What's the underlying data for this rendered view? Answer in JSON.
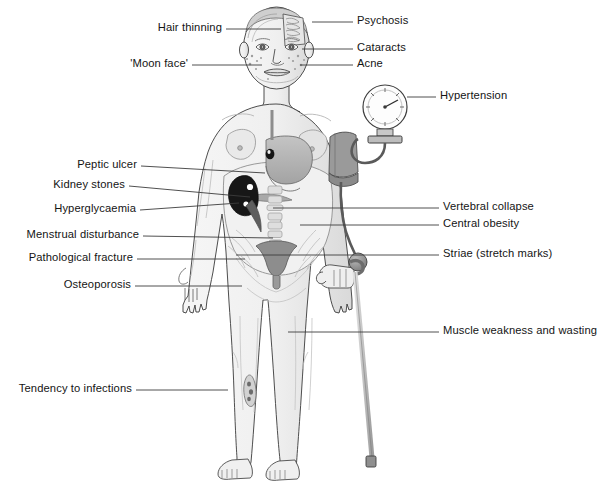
{
  "figure": {
    "background_color": "#ffffff",
    "line_color": "#3c3c3c",
    "text_color": "#141414",
    "skin_fill": "#f2f2f2",
    "skin_shadow": "#dcdcdc",
    "organ_fill": "#b8b8b8",
    "organ_dark": "#8f8f8f",
    "kidney_fill": "#171717",
    "stone_fill": "#ffffff",
    "cuff_fill": "#9a9a9a",
    "gauge_fill": "#fdfdfd",
    "cane_fill": "#c9c9c9"
  },
  "labels_left": [
    {
      "id": "hair-thinning",
      "text": "Hair thinning",
      "text_x": 222,
      "text_y": 32,
      "line_x1": 226,
      "line_y1": 29,
      "line_x2": 281,
      "line_y2": 29
    },
    {
      "id": "moon-face",
      "text": "'Moon face'",
      "text_x": 188,
      "text_y": 68,
      "line_x1": 192,
      "line_y1": 65,
      "line_x2": 262,
      "line_y2": 65
    },
    {
      "id": "peptic-ulcer",
      "text": "Peptic ulcer",
      "text_x": 137,
      "text_y": 169,
      "line_x1": 141,
      "line_y1": 166,
      "line_x2": 265,
      "line_y2": 173
    },
    {
      "id": "kidney-stones",
      "text": "Kidney stones",
      "text_x": 125,
      "text_y": 189,
      "line_x1": 129,
      "line_y1": 186,
      "line_x2": 250,
      "line_y2": 197
    },
    {
      "id": "hyperglycaemia",
      "text": "Hyperglycaemia",
      "text_x": 136,
      "text_y": 213,
      "line_x1": 140,
      "line_y1": 210,
      "line_x2": 239,
      "line_y2": 203
    },
    {
      "id": "menstrual-disturbance",
      "text": "Menstrual disturbance",
      "text_x": 139,
      "text_y": 239,
      "line_x1": 143,
      "line_y1": 236,
      "line_x2": 273,
      "line_y2": 238
    },
    {
      "id": "pathological-fracture",
      "text": "Pathological fracture",
      "text_x": 133,
      "text_y": 262,
      "line_x1": 137,
      "line_y1": 259,
      "line_x2": 245,
      "line_y2": 259
    },
    {
      "id": "osteoporosis",
      "text": "Osteoporosis",
      "text_x": 131,
      "text_y": 289,
      "line_x1": 135,
      "line_y1": 286,
      "line_x2": 242,
      "line_y2": 286
    },
    {
      "id": "tendency-to-infections",
      "text": "Tendency to infections",
      "text_x": 132,
      "text_y": 393,
      "line_x1": 136,
      "line_y1": 390,
      "line_x2": 228,
      "line_y2": 390
    }
  ],
  "labels_right": [
    {
      "id": "psychosis",
      "text": "Psychosis",
      "text_x": 357,
      "text_y": 25,
      "line_x1": 312,
      "line_y1": 22,
      "line_x2": 353,
      "line_y2": 22
    },
    {
      "id": "cataracts",
      "text": "Cataracts",
      "text_x": 357,
      "text_y": 52,
      "line_x1": 302,
      "line_y1": 49,
      "line_x2": 353,
      "line_y2": 49
    },
    {
      "id": "acne",
      "text": "Acne",
      "text_x": 357,
      "text_y": 68,
      "line_x1": 300,
      "line_y1": 65,
      "line_x2": 353,
      "line_y2": 65
    },
    {
      "id": "hypertension",
      "text": "Hypertension",
      "text_x": 440,
      "text_y": 100,
      "line_x1": 407,
      "line_y1": 97,
      "line_x2": 436,
      "line_y2": 97
    },
    {
      "id": "vertebral-collapse",
      "text": "Vertebral collapse",
      "text_x": 443,
      "text_y": 211,
      "line_x1": 273,
      "line_y1": 208,
      "line_x2": 439,
      "line_y2": 208
    },
    {
      "id": "central-obesity",
      "text": "Central obesity",
      "text_x": 443,
      "text_y": 228,
      "line_x1": 300,
      "line_y1": 225,
      "line_x2": 439,
      "line_y2": 225
    },
    {
      "id": "striae",
      "text": "Striae (stretch marks)",
      "text_x": 443,
      "text_y": 258,
      "line_x1": 236,
      "line_y1": 255,
      "line_x2": 439,
      "line_y2": 255
    },
    {
      "id": "muscle-weakness",
      "text": "Muscle weakness and wasting",
      "text_x": 443,
      "text_y": 335,
      "line_x1": 288,
      "line_y1": 332,
      "line_x2": 439,
      "line_y2": 332
    }
  ],
  "caption": {
    "text": ""
  },
  "body_parts": [
    {
      "id": "head",
      "name": "head-with-brain-cutaway"
    },
    {
      "id": "eyes",
      "name": "eyes-showing-cataracts"
    },
    {
      "id": "cheeks",
      "name": "acne-spots"
    },
    {
      "id": "torso",
      "name": "central-obesity-torso"
    },
    {
      "id": "stomach",
      "name": "stomach-with-peptic-ulcer"
    },
    {
      "id": "kidney",
      "name": "kidney-with-stones"
    },
    {
      "id": "spine",
      "name": "vertebral-column"
    },
    {
      "id": "uterus",
      "name": "uterus"
    },
    {
      "id": "striae",
      "name": "abdominal-striae"
    },
    {
      "id": "cuff",
      "name": "blood-pressure-cuff"
    },
    {
      "id": "gauge",
      "name": "sphygmomanometer-gauge"
    },
    {
      "id": "cane",
      "name": "walking-cane"
    },
    {
      "id": "leg-sore",
      "name": "leg-skin-infection"
    }
  ]
}
